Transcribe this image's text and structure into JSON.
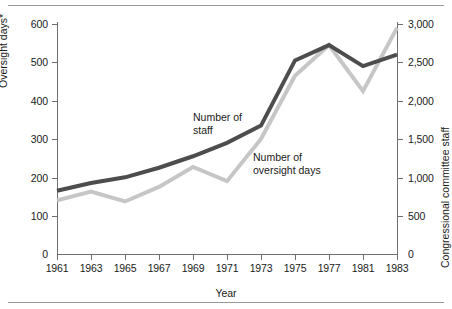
{
  "chart_data": {
    "type": "line",
    "title": "",
    "xlabel": "Year",
    "ylabel": "Oversight days*",
    "ylabel_right": "Congressional committee staff",
    "grid": false,
    "legend": "inline-annotations",
    "x": [
      1961,
      1963,
      1965,
      1967,
      1969,
      1971,
      1973,
      1975,
      1977,
      1981,
      1983
    ],
    "xtick_labels": [
      "1961",
      "1963",
      "1965",
      "1967",
      "1969",
      "1971",
      "1973",
      "1975",
      "1977",
      "1981",
      "1983"
    ],
    "ylim": [
      0,
      600
    ],
    "ytick_labels": [
      "0",
      "100",
      "200",
      "300",
      "400",
      "500",
      "600"
    ],
    "ytick_values": [
      0,
      100,
      200,
      300,
      400,
      500,
      600
    ],
    "ylim_right": [
      0,
      3000
    ],
    "ytick_labels_right": [
      "0",
      "500",
      "1,000",
      "1,500",
      "2,000",
      "2,500",
      "3,000"
    ],
    "ytick_values_right": [
      0,
      500,
      1000,
      1500,
      2000,
      2500,
      3000
    ],
    "series": [
      {
        "name": "Number of staff",
        "axis": "right",
        "color": "#4d4d4d",
        "values": [
          825,
          925,
          1000,
          1125,
          1275,
          1450,
          1675,
          2525,
          2725,
          2450,
          2600
        ]
      },
      {
        "name": "Number of oversight days",
        "axis": "left",
        "color": "#c6c6c6",
        "values": [
          140,
          163,
          137,
          175,
          227,
          190,
          300,
          465,
          545,
          425,
          590
        ]
      }
    ],
    "annotations": [
      {
        "text": "Number of\nstaff",
        "line": "Number of staff"
      },
      {
        "text": "Number of\noversight days",
        "line": "Number of oversight days"
      }
    ]
  },
  "labels": {
    "y_left_title": "Oversight days*",
    "y_right_title": "Congressional committee staff",
    "x_title": "Year",
    "series_staff_line1": "Number of",
    "series_staff_line2": "staff",
    "series_oversight_line1": "Number of",
    "series_oversight_line2": "oversight days"
  },
  "ticks": {
    "y_left": [
      "600",
      "500",
      "400",
      "300",
      "200",
      "100",
      "0"
    ],
    "y_right": [
      "3,000",
      "2,500",
      "2,000",
      "1,500",
      "1,000",
      "500",
      "0"
    ],
    "x": [
      "1961",
      "1963",
      "1965",
      "1967",
      "1969",
      "1971",
      "1973",
      "1975",
      "1977",
      "1981",
      "1983"
    ]
  },
  "colors": {
    "dark_line": "#4d4d4d",
    "light_line": "#c6c6c6",
    "axis": "#6f6f6f",
    "rule": "#9a9a9a",
    "text": "#1a1a1a",
    "background": "#ffffff"
  }
}
